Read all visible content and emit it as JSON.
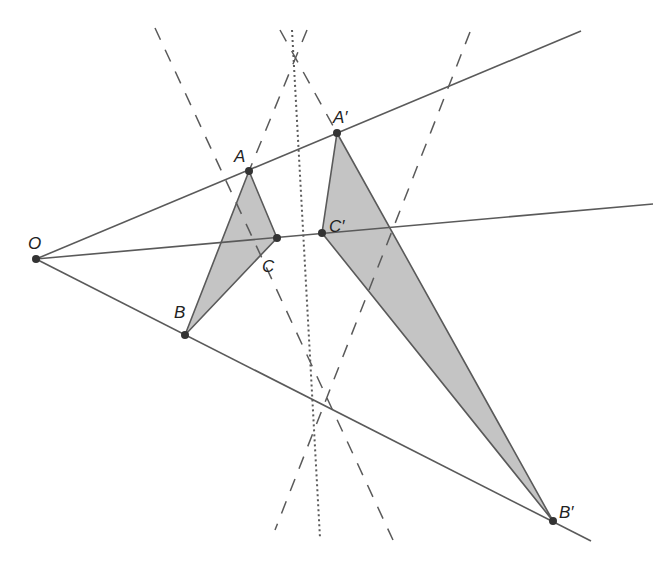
{
  "diagram": {
    "colors": {
      "line": "#5a5a5a",
      "fill": "#c4c4c4",
      "point": "#333333",
      "text": "#222222"
    },
    "points": {
      "O": {
        "label": "O",
        "x": 36,
        "y": 259,
        "lx": 28,
        "ly": 249
      },
      "A": {
        "label": "A",
        "x": 249,
        "y": 171,
        "lx": 234,
        "ly": 162
      },
      "B": {
        "label": "B",
        "x": 185,
        "y": 335,
        "lx": 174,
        "ly": 318
      },
      "C": {
        "label": "C",
        "x": 277,
        "y": 238,
        "lx": 262,
        "ly": 272
      },
      "A1": {
        "label": "A′",
        "x": 337,
        "y": 133,
        "lx": 333,
        "ly": 123
      },
      "B1": {
        "label": "B′",
        "x": 553,
        "y": 521,
        "lx": 559,
        "ly": 518
      },
      "C1": {
        "label": "C′",
        "x": 322,
        "y": 233,
        "lx": 329,
        "ly": 232
      }
    },
    "rays": [
      {
        "name": "ray-OA",
        "x2": 581,
        "y2": 31
      },
      {
        "name": "ray-OC",
        "x2": 653,
        "y2": 204
      },
      {
        "name": "ray-OB",
        "x2": 591,
        "y2": 541
      }
    ],
    "dashed_lines": [
      {
        "name": "dashed-line-1",
        "x1": 155,
        "y1": 28,
        "x2": 393,
        "y2": 540
      },
      {
        "name": "dashed-line-2",
        "x1": 470,
        "y1": 32,
        "x2": 275,
        "y2": 530
      },
      {
        "name": "dashed-line-3",
        "x1": 307,
        "y1": 30,
        "x2": 249,
        "y2": 171
      },
      {
        "name": "dashed-line-4",
        "x1": 280,
        "y1": 30,
        "x2": 337,
        "y2": 133
      }
    ],
    "dotted_line": {
      "x1": 292,
      "y1": 30,
      "x2": 320,
      "y2": 538
    }
  }
}
